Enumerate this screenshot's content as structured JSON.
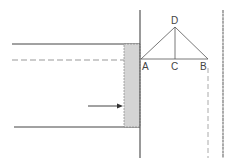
{
  "diagram": {
    "labels": {
      "A": "A",
      "B": "B",
      "C": "C",
      "D": "D"
    },
    "colors": {
      "line": "#444444",
      "dashed": "#999999",
      "fill": "#d4d4d4"
    }
  }
}
